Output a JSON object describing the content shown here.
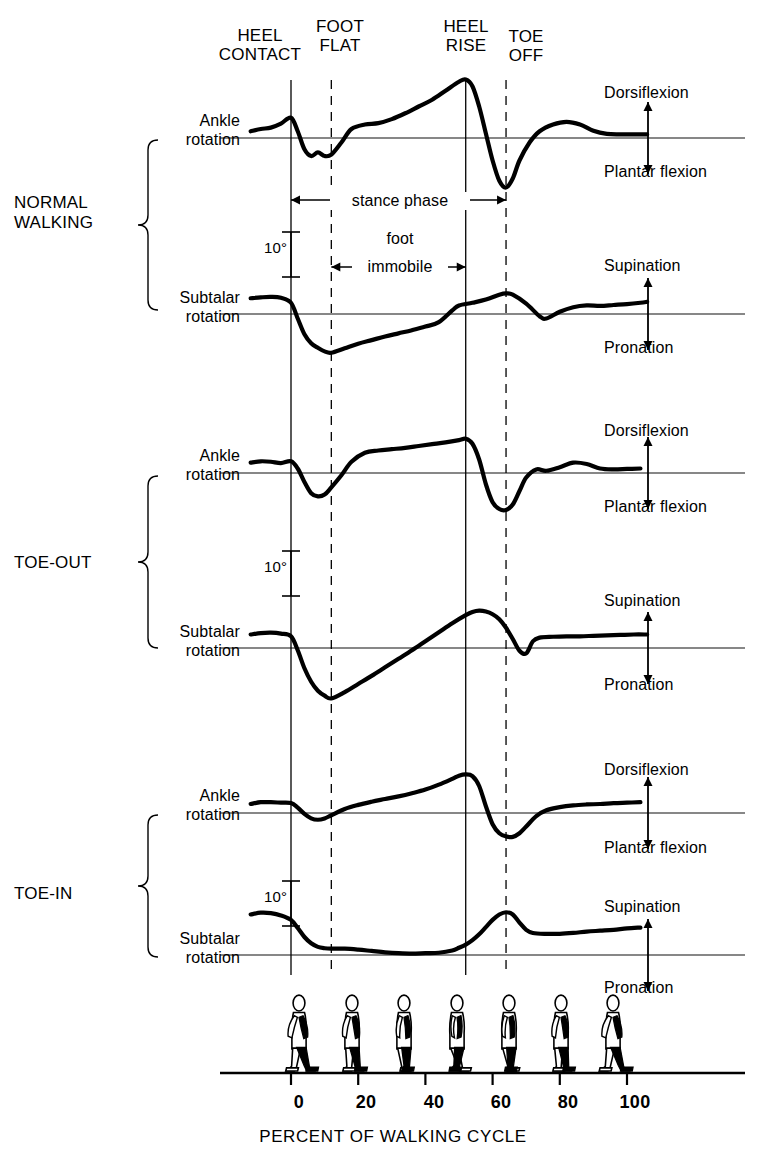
{
  "figure": {
    "xaxis_title": "PERCENT OF WALKING CYCLE",
    "scale_marker_label": "10°"
  },
  "event_labels": [
    {
      "name": "heel-contact",
      "line1": "HEEL",
      "line2": "CONTACT",
      "percent": 0,
      "line_style": "solid"
    },
    {
      "name": "foot-flat",
      "line1": "FOOT",
      "line2": "FLAT",
      "percent": 12,
      "line_style": "dashed"
    },
    {
      "name": "heel-rise",
      "line1": "HEEL",
      "line2": "RISE",
      "percent": 52,
      "line_style": "solid"
    },
    {
      "name": "toe-off",
      "line1": "TOE",
      "line2": "OFF",
      "percent": 64,
      "line_style": "dashed"
    }
  ],
  "phase_annotations": [
    {
      "name": "stance-phase",
      "label": "stance phase",
      "from_percent": 0,
      "to_percent": 64
    },
    {
      "name": "foot-immobile",
      "label_top": "foot",
      "label": "immobile",
      "from_percent": 12,
      "to_percent": 52
    }
  ],
  "groups": [
    {
      "name": "normal-walking",
      "line1": "NORMAL",
      "line2": "WALKING"
    },
    {
      "name": "toe-out",
      "line1": "TOE-OUT",
      "line2": ""
    },
    {
      "name": "toe-in",
      "line1": "TOE-IN",
      "line2": ""
    }
  ],
  "row_labels": [
    {
      "line1": "Ankle",
      "line2": "rotation"
    },
    {
      "line1": "Subtalar",
      "line2": "rotation"
    },
    {
      "line1": "Ankle",
      "line2": "rotation"
    },
    {
      "line1": "Subtalar",
      "line2": "rotation"
    },
    {
      "line1": "Ankle",
      "line2": "rotation"
    },
    {
      "line1": "Subtalar",
      "line2": "rotation"
    }
  ],
  "direction_labels": [
    {
      "positive": "Dorsiflexion",
      "negative": "Plantar flexion"
    },
    {
      "positive": "Supination",
      "negative": "Pronation"
    },
    {
      "positive": "Dorsiflexion",
      "negative": "Plantar flexion"
    },
    {
      "positive": "Supination",
      "negative": "Pronation"
    },
    {
      "positive": "Dorsiflexion",
      "negative": "Plantar flexion"
    },
    {
      "positive": "Supination",
      "negative": "Pronation"
    }
  ],
  "colors": {
    "ink": "#000000",
    "baseline": "#1a1a1a",
    "trace": "#000000"
  },
  "chart_data": {
    "type": "line",
    "xlabel": "PERCENT OF WALKING CYCLE",
    "ylabel": "rotation (degrees)",
    "xlim": [
      -12,
      108
    ],
    "xticks": [
      0,
      20,
      40,
      60,
      80,
      100
    ],
    "xticklabels": [
      "0",
      "20",
      "40",
      "60",
      "80",
      "100"
    ],
    "grid": false,
    "legend": "none",
    "scale_bar_degrees": 10,
    "events": {
      "heel_contact": 0,
      "foot_flat": 12,
      "heel_rise": 52,
      "toe_off": 64
    },
    "series": [
      {
        "name": "Normal walking — ankle rotation",
        "group": "NORMAL WALKING",
        "measure": "Ankle rotation",
        "positive_direction": "Dorsiflexion",
        "negative_direction": "Plantar flexion",
        "x": [
          -12,
          -9,
          -6,
          -3,
          0,
          2,
          4,
          6,
          8,
          10,
          12,
          15,
          18,
          22,
          26,
          30,
          34,
          38,
          42,
          46,
          50,
          52,
          54,
          56,
          58,
          60,
          62,
          64,
          66,
          68,
          71,
          74,
          78,
          82,
          86,
          90,
          94,
          98,
          102,
          106
        ],
        "y": [
          1.5,
          2.0,
          2.3,
          3.2,
          4.5,
          1.5,
          -2.5,
          -4.0,
          -3.2,
          -4.0,
          -3.7,
          -1.0,
          2.0,
          3.0,
          3.3,
          4.2,
          5.5,
          7.0,
          8.5,
          10.5,
          12.5,
          13.0,
          11.5,
          7.0,
          1.0,
          -5.0,
          -9.5,
          -11.0,
          -9.0,
          -5.0,
          -1.0,
          1.5,
          3.0,
          3.6,
          3.0,
          1.6,
          0.9,
          0.8,
          0.8,
          0.8
        ]
      },
      {
        "name": "Normal walking — subtalar rotation",
        "group": "NORMAL WALKING",
        "measure": "Subtalar rotation",
        "positive_direction": "Supination",
        "negative_direction": "Pronation",
        "x": [
          -12,
          -9,
          -6,
          -3,
          0,
          2,
          4,
          6,
          8,
          10,
          12,
          16,
          20,
          24,
          28,
          32,
          36,
          40,
          44,
          48,
          50,
          54,
          58,
          62,
          64,
          66,
          70,
          74,
          76,
          80,
          84,
          88,
          92,
          96,
          100,
          104,
          106
        ],
        "y": [
          3.5,
          3.7,
          3.8,
          3.6,
          2.5,
          -1.0,
          -4.5,
          -6.5,
          -7.5,
          -8.3,
          -8.6,
          -7.6,
          -6.6,
          -5.8,
          -5.0,
          -4.3,
          -3.6,
          -2.8,
          -1.8,
          0.8,
          1.9,
          2.5,
          3.2,
          4.3,
          4.6,
          4.3,
          2.3,
          -0.5,
          -1.0,
          0.5,
          1.5,
          1.9,
          1.8,
          2.0,
          2.2,
          2.5,
          2.7
        ]
      },
      {
        "name": "Toe-out — ankle rotation",
        "group": "TOE-OUT",
        "measure": "Ankle rotation",
        "positive_direction": "Dorsiflexion",
        "negative_direction": "Plantar flexion",
        "x": [
          -12,
          -9,
          -6,
          -3,
          0,
          2,
          4,
          6,
          8,
          10,
          12,
          15,
          18,
          22,
          26,
          30,
          34,
          38,
          42,
          46,
          50,
          52,
          54,
          56,
          58,
          60,
          62,
          64,
          66,
          68,
          70,
          73,
          76,
          80,
          84,
          88,
          92,
          96,
          100,
          104
        ],
        "y": [
          2.3,
          2.6,
          2.5,
          2.2,
          2.6,
          1.0,
          -2.0,
          -4.5,
          -5.2,
          -4.8,
          -3.2,
          -0.5,
          2.5,
          4.5,
          5.0,
          5.3,
          5.6,
          6.0,
          6.4,
          6.8,
          7.3,
          7.6,
          6.5,
          3.0,
          -2.5,
          -6.5,
          -8.0,
          -8.2,
          -7.0,
          -4.0,
          -1.0,
          0.8,
          0.5,
          1.3,
          2.3,
          2.0,
          1.0,
          0.8,
          0.9,
          1.0
        ]
      },
      {
        "name": "Toe-out — subtalar rotation",
        "group": "TOE-OUT",
        "measure": "Subtalar rotation",
        "positive_direction": "Supination",
        "negative_direction": "Pronation",
        "x": [
          -12,
          -9,
          -6,
          -3,
          0,
          2,
          4,
          6,
          8,
          10,
          12,
          16,
          20,
          24,
          28,
          32,
          36,
          40,
          44,
          48,
          52,
          54,
          56,
          58,
          60,
          62,
          64,
          66,
          68,
          70,
          72,
          74,
          78,
          82,
          86,
          90,
          94,
          98,
          102,
          106
        ],
        "y": [
          3.0,
          3.3,
          3.4,
          3.2,
          2.6,
          -0.5,
          -4.5,
          -7.5,
          -9.5,
          -10.6,
          -11.2,
          -9.8,
          -8.0,
          -6.2,
          -4.3,
          -2.4,
          -0.5,
          1.5,
          3.5,
          5.5,
          7.3,
          8.0,
          8.3,
          8.1,
          7.5,
          6.4,
          4.5,
          2.0,
          -0.6,
          -1.2,
          1.5,
          2.3,
          2.5,
          2.6,
          2.6,
          2.7,
          2.8,
          2.9,
          3.0,
          3.0
        ]
      },
      {
        "name": "Toe-in — ankle rotation",
        "group": "TOE-IN",
        "measure": "Ankle rotation",
        "positive_direction": "Dorsiflexion",
        "negative_direction": "Plantar flexion",
        "x": [
          -12,
          -9,
          -6,
          -3,
          0,
          2,
          4,
          6,
          8,
          10,
          12,
          16,
          20,
          24,
          28,
          32,
          36,
          40,
          44,
          48,
          50,
          52,
          54,
          56,
          58,
          60,
          62,
          64,
          66,
          68,
          70,
          73,
          76,
          80,
          84,
          88,
          92,
          96,
          100,
          104
        ],
        "y": [
          2.0,
          2.4,
          2.4,
          2.3,
          2.2,
          1.2,
          -0.2,
          -1.2,
          -1.5,
          -1.2,
          -0.5,
          0.9,
          1.8,
          2.5,
          3.1,
          3.7,
          4.4,
          5.2,
          6.3,
          7.6,
          8.3,
          8.6,
          8.2,
          6.0,
          1.5,
          -2.5,
          -4.5,
          -5.2,
          -5.3,
          -4.5,
          -3.0,
          -0.7,
          0.6,
          1.3,
          1.7,
          1.9,
          2.0,
          2.2,
          2.3,
          2.4
        ]
      },
      {
        "name": "Toe-in — subtalar rotation",
        "group": "TOE-IN",
        "measure": "Subtalar rotation",
        "positive_direction": "Supination",
        "negative_direction": "Pronation",
        "x": [
          -12,
          -9,
          -6,
          -3,
          0,
          2,
          4,
          6,
          8,
          10,
          12,
          16,
          20,
          24,
          28,
          32,
          36,
          40,
          44,
          48,
          50,
          52,
          54,
          56,
          58,
          60,
          62,
          64,
          66,
          68,
          70,
          72,
          76,
          80,
          84,
          88,
          92,
          96,
          100,
          104
        ],
        "y": [
          9.0,
          9.4,
          9.3,
          8.8,
          7.8,
          6.0,
          4.0,
          2.6,
          1.8,
          1.5,
          1.4,
          1.4,
          1.2,
          0.9,
          0.6,
          0.4,
          0.3,
          0.4,
          0.5,
          1.0,
          1.6,
          2.3,
          3.3,
          4.6,
          6.2,
          7.8,
          9.0,
          9.5,
          9.0,
          7.2,
          5.6,
          4.9,
          4.7,
          4.7,
          4.9,
          5.2,
          5.4,
          5.6,
          5.9,
          6.1
        ]
      }
    ]
  }
}
